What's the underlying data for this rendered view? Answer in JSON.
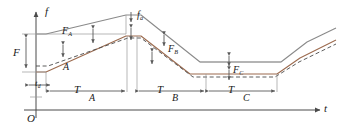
{
  "figure": {
    "type": "engineering-line-diagram",
    "background": "#ffffff"
  },
  "axes": {
    "y_label": "f",
    "x_label": "t",
    "origin_label": "O",
    "axis_color": "#4a4a4a"
  },
  "colors": {
    "upper_curve": "#8a8a8a",
    "lower_curve": "#9c6b4f",
    "dashed_curve": "#4a4a4a",
    "axis": "#4a4a4a",
    "annotation": "#5a5a5a",
    "text": "#1a1a1a"
  },
  "annotations": {
    "force_level": {
      "base": "F",
      "sub": ""
    },
    "force_a": {
      "base": "F",
      "sub": "A"
    },
    "force_b": {
      "base": "F",
      "sub": "B"
    },
    "force_c": {
      "base": "F",
      "sub": "C"
    },
    "peak": {
      "base": "f",
      "sub": "a"
    },
    "delay_time": {
      "base": "t",
      "sub": "d"
    },
    "segment_a_label": {
      "base": "A",
      "sub": ""
    },
    "time_a": {
      "base": "T",
      "sub": "A"
    },
    "time_b": {
      "base": "T",
      "sub": "B"
    },
    "time_c": {
      "base": "T",
      "sub": "C"
    }
  },
  "chart_data": {
    "type": "line",
    "title": "",
    "xlabel": "t",
    "ylabel": "f",
    "grid": false,
    "legend": "none",
    "xlim": [
      0,
      337
    ],
    "ylim": [
      0,
      129
    ],
    "series": [
      {
        "name": "upper-solid",
        "style": "solid",
        "color": "#8a8a8a",
        "points": "36,34 46,34 126,15 141,15 200,62 281,62 307,42 336,28"
      },
      {
        "name": "lower-solid",
        "style": "solid",
        "color": "#9c6b4f",
        "points": "36,72 46,72 126,36 141,36 190,74 277,74 300,58 336,40"
      },
      {
        "name": "dashed",
        "style": "dashed",
        "color": "#4a4a4a",
        "points": "36,66 48,66 128,38 141,38 193,77 275,77 299,62 336,44"
      }
    ]
  },
  "measures": {
    "vertical": [
      {
        "name": "F",
        "x": 26,
        "y_top": 34,
        "y_bottom": 72
      },
      {
        "name": "F_A",
        "x": 93,
        "y_top": 30,
        "y_bottom": 52
      },
      {
        "name": "F_B",
        "x": 164,
        "y_top": 36,
        "y_bottom": 58
      },
      {
        "name": "F_C",
        "x": 229,
        "y_top": 62,
        "y_bottom": 74
      },
      {
        "name": "f_a",
        "x": 131,
        "y_top": 10,
        "y_bottom": 21
      }
    ],
    "horizontal": [
      {
        "name": "t_d",
        "x_left": 27,
        "x_right": 52,
        "y": 84
      },
      {
        "name": "T_A",
        "x_left": 52,
        "x_right": 127,
        "y": 90
      },
      {
        "name": "T_B",
        "x_left": 137,
        "x_right": 203,
        "y": 90
      },
      {
        "name": "T_C",
        "x_left": 207,
        "x_right": 277,
        "y": 90
      }
    ]
  }
}
